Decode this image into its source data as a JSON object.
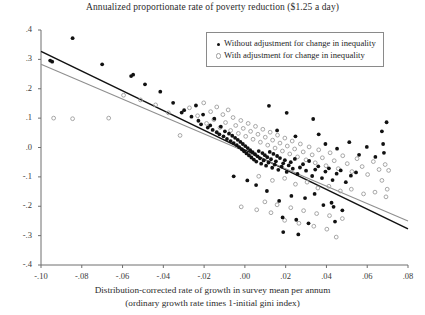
{
  "chart_data": {
    "type": "scatter",
    "title": "Annualized proportionate rate of poverty reduction ($1.25 a day)",
    "xlabel_line1": "Distribution-corrected rate of growth in survey mean per annum",
    "xlabel_line2": "(ordinary growth rate times 1-initial gini index)",
    "ylabel": "",
    "xlim": [
      -0.1,
      0.08
    ],
    "ylim": [
      -0.4,
      0.4
    ],
    "xticks": [
      -0.1,
      -0.08,
      -0.06,
      -0.04,
      -0.02,
      0.0,
      0.02,
      0.04,
      0.06,
      0.08
    ],
    "xticklabels": [
      "-.10",
      "-.08",
      "-.06",
      "-.04",
      "-.02",
      ".00",
      ".02",
      ".04",
      ".06",
      ".08"
    ],
    "yticks": [
      -0.4,
      -0.3,
      -0.2,
      -0.1,
      0.0,
      0.1,
      0.2,
      0.3,
      0.4
    ],
    "yticklabels": [
      "-.4",
      "-.3",
      "-.2",
      "-.1",
      ".0",
      ".1",
      ".2",
      ".3",
      ".4"
    ],
    "grid": false,
    "legend_position": "top-right",
    "colors": {
      "series1": "#111111",
      "series2": "#9d9d9d",
      "axis": "#6e6e6e"
    },
    "series": [
      {
        "name": "Without adjustment for change in inequality",
        "marker": "filled-dot",
        "color": "#111111",
        "points": [
          [
            -0.0955,
            0.296
          ],
          [
            -0.0945,
            0.292
          ],
          [
            -0.0845,
            0.372
          ],
          [
            -0.07,
            0.283
          ],
          [
            -0.0558,
            0.243
          ],
          [
            -0.0548,
            0.248
          ],
          [
            -0.049,
            0.215
          ],
          [
            -0.0415,
            0.19
          ],
          [
            -0.0352,
            0.152
          ],
          [
            -0.031,
            0.119
          ],
          [
            -0.0298,
            0.127
          ],
          [
            -0.0262,
            0.105
          ],
          [
            -0.024,
            0.143
          ],
          [
            -0.0228,
            0.091
          ],
          [
            -0.0215,
            0.079
          ],
          [
            -0.0205,
            0.112
          ],
          [
            -0.0182,
            0.068
          ],
          [
            -0.017,
            0.075
          ],
          [
            -0.0158,
            0.06
          ],
          [
            -0.015,
            0.098
          ],
          [
            -0.0138,
            0.052
          ],
          [
            -0.0125,
            0.045
          ],
          [
            -0.0118,
            0.071
          ],
          [
            -0.0105,
            0.038
          ],
          [
            -0.0098,
            0.055
          ],
          [
            -0.0088,
            0.029
          ],
          [
            -0.0078,
            0.047
          ],
          [
            -0.007,
            0.022
          ],
          [
            -0.0062,
            0.04
          ],
          [
            -0.0055,
            0.015
          ],
          [
            -0.0048,
            0.033
          ],
          [
            -0.004,
            0.008
          ],
          [
            -0.0035,
            0.026
          ],
          [
            -0.0028,
            0.001
          ],
          [
            -0.0022,
            0.019
          ],
          [
            -0.0015,
            -0.006
          ],
          [
            -0.001,
            0.012
          ],
          [
            -0.0004,
            -0.013
          ],
          [
            0.0002,
            0.005
          ],
          [
            0.0008,
            -0.02
          ],
          [
            0.0014,
            -0.002
          ],
          [
            0.002,
            -0.027
          ],
          [
            0.0026,
            -0.009
          ],
          [
            0.0032,
            -0.034
          ],
          [
            0.0038,
            -0.016
          ],
          [
            0.0044,
            -0.041
          ],
          [
            0.005,
            -0.023
          ],
          [
            0.0056,
            -0.048
          ],
          [
            0.0062,
            -0.03
          ],
          [
            0.0068,
            -0.012
          ],
          [
            0.0074,
            -0.037
          ],
          [
            0.008,
            -0.055
          ],
          [
            0.0086,
            -0.019
          ],
          [
            0.0092,
            -0.044
          ],
          [
            0.0098,
            -0.026
          ],
          [
            0.0104,
            -0.062
          ],
          [
            0.011,
            -0.033
          ],
          [
            0.0116,
            -0.051
          ],
          [
            0.0122,
            -0.015
          ],
          [
            0.0128,
            -0.04
          ],
          [
            0.0134,
            -0.069
          ],
          [
            0.014,
            -0.022
          ],
          [
            0.0146,
            -0.058
          ],
          [
            0.0152,
            -0.047
          ],
          [
            0.0158,
            -0.029
          ],
          [
            0.0164,
            -0.076
          ],
          [
            0.0172,
            -0.036
          ],
          [
            0.018,
            -0.065
          ],
          [
            0.0188,
            -0.054
          ],
          [
            0.0196,
            -0.043
          ],
          [
            0.0205,
            -0.083
          ],
          [
            0.0215,
            -0.061
          ],
          [
            0.0225,
            -0.05
          ],
          [
            0.0235,
            -0.072
          ],
          [
            0.0245,
            -0.039
          ],
          [
            0.0258,
            -0.09
          ],
          [
            0.027,
            -0.068
          ],
          [
            0.0285,
            -0.057
          ],
          [
            0.03,
            -0.079
          ],
          [
            0.0315,
            -0.046
          ],
          [
            0.033,
            -0.097
          ],
          [
            0.0345,
            -0.075
          ],
          [
            0.036,
            -0.064
          ],
          [
            0.0378,
            -0.104
          ],
          [
            0.0395,
            -0.082
          ],
          [
            0.0412,
            -0.071
          ],
          [
            0.043,
            -0.111
          ],
          [
            0.045,
            -0.089
          ],
          [
            0.047,
            -0.078
          ],
          [
            0.0495,
            -0.118
          ],
          [
            0.052,
            -0.096
          ],
          [
            0.0545,
            -0.085
          ],
          [
            0.0118,
            0.142
          ],
          [
            0.0205,
            0.118
          ],
          [
            0.0335,
            0.097
          ],
          [
            0.0158,
            0.058
          ],
          [
            0.0248,
            0.038
          ],
          [
            0.0362,
            0.045
          ],
          [
            0.0395,
            0.012
          ],
          [
            0.0452,
            -0.004
          ],
          [
            0.0512,
            0.018
          ],
          [
            0.056,
            -0.025
          ],
          [
            0.0598,
            0.002
          ],
          [
            0.064,
            -0.032
          ],
          [
            0.0672,
            0.055
          ],
          [
            0.0678,
            0.012
          ],
          [
            0.0682,
            -0.018
          ],
          [
            0.0695,
            0.086
          ],
          [
            0.0228,
            -0.165
          ],
          [
            0.0295,
            -0.172
          ],
          [
            0.0342,
            -0.158
          ],
          [
            0.0108,
            -0.148
          ],
          [
            0.0168,
            -0.182
          ],
          [
            0.0385,
            -0.196
          ],
          [
            0.0425,
            -0.188
          ],
          [
            0.0435,
            -0.202
          ],
          [
            0.0478,
            -0.214
          ],
          [
            0.0185,
            -0.238
          ],
          [
            0.0252,
            -0.246
          ],
          [
            0.0312,
            -0.258
          ],
          [
            0.0055,
            -0.128
          ],
          [
            0.0012,
            -0.112
          ],
          [
            -0.0055,
            -0.098
          ],
          [
            0.0442,
            -0.252
          ],
          [
            0.0188,
            -0.288
          ],
          [
            0.0262,
            -0.296
          ]
        ]
      },
      {
        "name": "With adjustment for change in inequality",
        "marker": "open-circle",
        "color": "#9d9d9d",
        "points": [
          [
            -0.0938,
            0.1
          ],
          [
            -0.0845,
            0.098
          ],
          [
            -0.0668,
            0.1
          ],
          [
            -0.0595,
            0.178
          ],
          [
            -0.0512,
            0.162
          ],
          [
            -0.0438,
            0.145
          ],
          [
            -0.0375,
            0.118
          ],
          [
            -0.0318,
            0.041
          ],
          [
            -0.0272,
            0.135
          ],
          [
            -0.0232,
            0.108
          ],
          [
            -0.0202,
            0.152
          ],
          [
            -0.0188,
            0.082
          ],
          [
            -0.0168,
            0.122
          ],
          [
            -0.0152,
            0.095
          ],
          [
            -0.0138,
            0.138
          ],
          [
            -0.0122,
            0.068
          ],
          [
            -0.0108,
            0.112
          ],
          [
            -0.0095,
            0.085
          ],
          [
            -0.0082,
            0.128
          ],
          [
            -0.007,
            0.058
          ],
          [
            -0.0058,
            0.102
          ],
          [
            -0.0045,
            0.075
          ],
          [
            -0.0032,
            0.048
          ],
          [
            -0.002,
            0.092
          ],
          [
            -0.0008,
            0.065
          ],
          [
            0.0004,
            0.038
          ],
          [
            0.0016,
            0.082
          ],
          [
            0.0028,
            0.055
          ],
          [
            0.004,
            0.028
          ],
          [
            0.0052,
            0.072
          ],
          [
            0.0064,
            0.045
          ],
          [
            0.0076,
            0.018
          ],
          [
            0.0088,
            0.062
          ],
          [
            0.01,
            0.035
          ],
          [
            0.0112,
            0.008
          ],
          [
            0.0124,
            0.052
          ],
          [
            0.0136,
            0.025
          ],
          [
            0.0148,
            -0.002
          ],
          [
            0.016,
            0.042
          ],
          [
            0.0172,
            0.015
          ],
          [
            0.0184,
            -0.012
          ],
          [
            0.0196,
            0.032
          ],
          [
            0.0208,
            0.005
          ],
          [
            0.022,
            -0.022
          ],
          [
            0.0232,
            0.022
          ],
          [
            0.0244,
            -0.005
          ],
          [
            0.0258,
            -0.032
          ],
          [
            0.0272,
            0.012
          ],
          [
            0.0286,
            -0.015
          ],
          [
            0.03,
            -0.042
          ],
          [
            0.0315,
            0.002
          ],
          [
            0.033,
            -0.025
          ],
          [
            0.0345,
            -0.052
          ],
          [
            0.0362,
            -0.008
          ],
          [
            0.038,
            -0.035
          ],
          [
            0.0398,
            -0.062
          ],
          [
            0.0418,
            -0.018
          ],
          [
            0.0438,
            -0.045
          ],
          [
            0.0458,
            -0.072
          ],
          [
            0.048,
            -0.028
          ],
          [
            0.0502,
            -0.055
          ],
          [
            0.0525,
            -0.082
          ],
          [
            0.055,
            -0.038
          ],
          [
            0.0575,
            -0.065
          ],
          [
            0.0602,
            -0.092
          ],
          [
            0.063,
            -0.048
          ],
          [
            0.0658,
            -0.075
          ],
          [
            0.0688,
            -0.058
          ],
          [
            0.0068,
            -0.098
          ],
          [
            0.0135,
            -0.112
          ],
          [
            0.0195,
            -0.105
          ],
          [
            0.0248,
            -0.125
          ],
          [
            0.0305,
            -0.118
          ],
          [
            0.0358,
            -0.138
          ],
          [
            0.0412,
            -0.132
          ],
          [
            0.0468,
            -0.148
          ],
          [
            0.0522,
            -0.142
          ],
          [
            0.0582,
            -0.158
          ],
          [
            0.0638,
            -0.152
          ],
          [
            0.0692,
            -0.168
          ],
          [
            0.0288,
            -0.215
          ],
          [
            0.0352,
            -0.225
          ],
          [
            0.0415,
            -0.232
          ],
          [
            0.0478,
            -0.242
          ],
          [
            0.0225,
            -0.205
          ],
          [
            0.0158,
            -0.195
          ],
          [
            0.0098,
            -0.185
          ],
          [
            0.0338,
            -0.268
          ],
          [
            0.0402,
            -0.278
          ],
          [
            0.0265,
            -0.258
          ],
          [
            0.0195,
            -0.248
          ],
          [
            0.0448,
            -0.305
          ],
          [
            0.0128,
            -0.222
          ],
          [
            0.0058,
            -0.212
          ],
          [
            -0.0018,
            -0.202
          ],
          [
            0.0672,
            -0.112
          ],
          [
            0.0698,
            -0.142
          ],
          [
            0.0705,
            -0.078
          ]
        ]
      }
    ],
    "fit_lines": [
      {
        "name": "fit-without-adjustment",
        "color": "#111111",
        "x1": -0.1,
        "y1": 0.327,
        "x2": 0.08,
        "y2": -0.277
      },
      {
        "name": "fit-with-adjustment",
        "color": "#8f8f8f",
        "x1": -0.1,
        "y1": 0.283,
        "x2": 0.08,
        "y2": -0.25
      }
    ]
  },
  "legend": {
    "items": [
      {
        "marker": "filled-dot",
        "label": "Without adjustment for change in inequality"
      },
      {
        "marker": "open-circle",
        "label": "With adjustment for change in inequality"
      }
    ]
  }
}
